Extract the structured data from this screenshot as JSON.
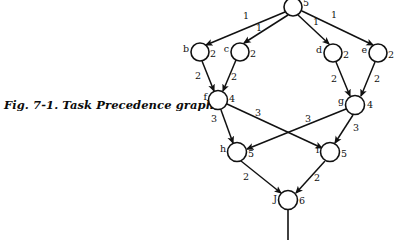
{
  "figure": {
    "caption": "Fig. 7-1. Task Precedence graph.",
    "colors": {
      "ink": "#111111",
      "background": "#ffffff"
    }
  },
  "graph": {
    "kind": "directed-acyclic-task-precedence-graph",
    "nodes": [
      {
        "id": "a",
        "letter": "",
        "weight": "5",
        "cx": 293,
        "cy": 7,
        "r": 9,
        "letter_x": 284,
        "letter_y": 11,
        "weight_x": 303,
        "weight_y": 6
      },
      {
        "id": "b",
        "letter": "b",
        "weight": "2",
        "cx": 200,
        "cy": 52,
        "r": 9,
        "letter_x": 189,
        "letter_y": 52,
        "weight_x": 210,
        "weight_y": 57
      },
      {
        "id": "c",
        "letter": "c",
        "weight": "2",
        "cx": 240,
        "cy": 52,
        "r": 9,
        "letter_x": 229,
        "letter_y": 52,
        "weight_x": 250,
        "weight_y": 57
      },
      {
        "id": "d",
        "letter": "d",
        "weight": "2",
        "cx": 333,
        "cy": 53,
        "r": 9,
        "letter_x": 322,
        "letter_y": 53,
        "weight_x": 343,
        "weight_y": 58
      },
      {
        "id": "e",
        "letter": "e",
        "weight": "2",
        "cx": 378,
        "cy": 53,
        "r": 9,
        "letter_x": 367,
        "letter_y": 53,
        "weight_x": 388,
        "weight_y": 58
      },
      {
        "id": "f",
        "letter": "f",
        "weight": "4",
        "cx": 218,
        "cy": 100,
        "r": 9.5,
        "letter_x": 207,
        "letter_y": 100,
        "weight_x": 229,
        "weight_y": 102
      },
      {
        "id": "g",
        "letter": "g",
        "weight": "4",
        "cx": 355,
        "cy": 105,
        "r": 9.5,
        "letter_x": 344,
        "letter_y": 104,
        "weight_x": 367,
        "weight_y": 108
      },
      {
        "id": "h",
        "letter": "h",
        "weight": "5",
        "cx": 237,
        "cy": 152,
        "r": 9.5,
        "letter_x": 226,
        "letter_y": 152,
        "weight_x": 248,
        "weight_y": 157
      },
      {
        "id": "i",
        "letter": "i",
        "weight": "5",
        "cx": 330,
        "cy": 152,
        "r": 9.5,
        "letter_x": 319,
        "letter_y": 153,
        "weight_x": 341,
        "weight_y": 157
      },
      {
        "id": "J",
        "letter": "J",
        "weight": "6",
        "cx": 288,
        "cy": 200,
        "r": 9.5,
        "letter_x": 277,
        "letter_y": 202,
        "weight_x": 299,
        "weight_y": 204
      }
    ],
    "edges": [
      {
        "id": "a-b",
        "from": "a",
        "to": "b",
        "weight": "1",
        "x1": 285,
        "y1": 12,
        "x2": 206,
        "y2": 45,
        "label_x": 246,
        "label_y": 19
      },
      {
        "id": "a-c",
        "from": "a",
        "to": "c",
        "weight": "1",
        "x1": 288,
        "y1": 15,
        "x2": 244,
        "y2": 43,
        "label_x": 259,
        "label_y": 31
      },
      {
        "id": "a-d",
        "from": "a",
        "to": "d",
        "weight": "1",
        "x1": 298,
        "y1": 15,
        "x2": 329,
        "y2": 44,
        "label_x": 316,
        "label_y": 25
      },
      {
        "id": "a-e",
        "from": "a",
        "to": "e",
        "weight": "1",
        "x1": 302,
        "y1": 11,
        "x2": 373,
        "y2": 45,
        "label_x": 334,
        "label_y": 18
      },
      {
        "id": "b-f",
        "from": "b",
        "to": "f",
        "weight": "2",
        "x1": 202,
        "y1": 61,
        "x2": 214,
        "y2": 91,
        "label_x": 198,
        "label_y": 79
      },
      {
        "id": "c-f",
        "from": "c",
        "to": "f",
        "weight": "2",
        "x1": 236,
        "y1": 60,
        "x2": 223,
        "y2": 91,
        "label_x": 234,
        "label_y": 80
      },
      {
        "id": "d-g",
        "from": "d",
        "to": "g",
        "weight": "2",
        "x1": 336,
        "y1": 62,
        "x2": 350,
        "y2": 96,
        "label_x": 334,
        "label_y": 82
      },
      {
        "id": "e-g",
        "from": "e",
        "to": "g",
        "weight": "2",
        "x1": 375,
        "y1": 62,
        "x2": 361,
        "y2": 96,
        "label_x": 377,
        "label_y": 82
      },
      {
        "id": "f-h",
        "from": "f",
        "to": "h",
        "weight": "3",
        "x1": 221,
        "y1": 110,
        "x2": 233,
        "y2": 143,
        "label_x": 214,
        "label_y": 122
      },
      {
        "id": "f-i",
        "from": "f",
        "to": "i",
        "weight": "3",
        "x1": 227,
        "y1": 104,
        "x2": 322,
        "y2": 148,
        "label_x": 258,
        "label_y": 116
      },
      {
        "id": "g-h",
        "from": "g",
        "to": "h",
        "weight": "3",
        "x1": 346,
        "y1": 109,
        "x2": 247,
        "y2": 149,
        "label_x": 308,
        "label_y": 122
      },
      {
        "id": "g-i",
        "from": "g",
        "to": "i",
        "weight": "3",
        "x1": 353,
        "y1": 115,
        "x2": 335,
        "y2": 143,
        "label_x": 356,
        "label_y": 131
      },
      {
        "id": "h-J",
        "from": "h",
        "to": "J",
        "weight": "2",
        "x1": 241,
        "y1": 161,
        "x2": 281,
        "y2": 193,
        "label_x": 246,
        "label_y": 180
      },
      {
        "id": "i-J",
        "from": "i",
        "to": "J",
        "weight": "2",
        "x1": 325,
        "y1": 161,
        "x2": 296,
        "y2": 193,
        "label_x": 317,
        "label_y": 181
      }
    ],
    "tail": {
      "id": "J-tail",
      "x1": 288,
      "y1": 210,
      "x2": 288,
      "y2": 240
    }
  }
}
